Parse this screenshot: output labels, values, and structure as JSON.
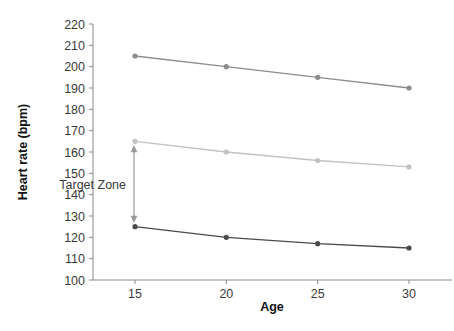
{
  "chart_data": {
    "type": "line",
    "title": "",
    "xlabel": "Age",
    "ylabel": "Heart rate (bpm)",
    "x": [
      15,
      20,
      25,
      30
    ],
    "xtick_labels": [
      "15",
      "20",
      "25",
      "30"
    ],
    "xlim": [
      13.2,
      32.0
    ],
    "ylim": [
      100,
      220
    ],
    "ytick_labels": [
      "100",
      "110",
      "120",
      "130",
      "140",
      "150",
      "160",
      "170",
      "180",
      "190",
      "200",
      "210",
      "220"
    ],
    "ytick_values": [
      100,
      110,
      120,
      130,
      140,
      150,
      160,
      170,
      180,
      190,
      200,
      210,
      220
    ],
    "grid": false,
    "legend": "none",
    "series": [
      {
        "name": "maximum-heart-rate",
        "values": [
          205,
          200,
          195,
          190
        ],
        "color": "#8c8c8c",
        "marker": "circle"
      },
      {
        "name": "upper-target-limit",
        "values": [
          165,
          160,
          156,
          153
        ],
        "color": "#c2c2c2",
        "marker": "circle"
      },
      {
        "name": "lower-target-limit",
        "values": [
          125,
          120,
          117,
          115
        ],
        "color": "#4a4a4a",
        "marker": "circle"
      }
    ],
    "annotations": [
      {
        "name": "target-zone",
        "text": "Target Zone",
        "at_x": 15,
        "from_y": 125,
        "to_y": 165,
        "arrow": "double-headed-vertical",
        "color": "#9a9a9a"
      }
    ]
  }
}
